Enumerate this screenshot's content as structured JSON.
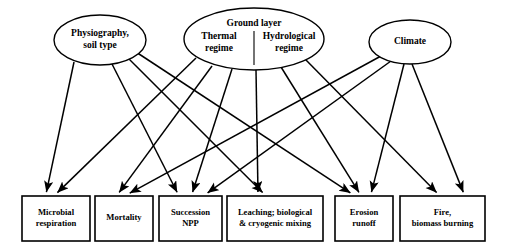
{
  "diagram": {
    "colors": {
      "background": "#ffffff",
      "stroke": "#000000",
      "text": "#000000"
    },
    "drivers": [
      {
        "id": "physiography",
        "shape": "ellipse",
        "lines": [
          "Physiography,",
          "soil type"
        ],
        "cx": 100,
        "cy": 40,
        "rx": 46,
        "ry": 25,
        "divider": false,
        "font_size": 9.5
      },
      {
        "id": "ground-layer",
        "shape": "ellipse",
        "lines": [
          "Ground layer",
          "Thermal",
          "regime",
          "Hydrological",
          "regime"
        ],
        "heading": "Ground layer",
        "left_label": [
          "Thermal",
          "regime"
        ],
        "right_label": [
          "Hydrological",
          "regime"
        ],
        "cx": 254,
        "cy": 39,
        "rx": 70,
        "ry": 31,
        "divider": true,
        "font_size": 9.5
      },
      {
        "id": "climate",
        "shape": "ellipse",
        "lines": [
          "Climate"
        ],
        "cx": 410,
        "cy": 42,
        "rx": 41,
        "ry": 22,
        "divider": false,
        "font_size": 9.5
      }
    ],
    "processes": [
      {
        "id": "microbial-respiration",
        "shape": "box",
        "lines": [
          "Microbial",
          "respiration"
        ],
        "x": 22,
        "y": 196,
        "w": 68,
        "h": 45,
        "font_size": 8.6
      },
      {
        "id": "mortality",
        "shape": "box",
        "lines": [
          "Mortality"
        ],
        "x": 95,
        "y": 196,
        "w": 58,
        "h": 45,
        "font_size": 8.6
      },
      {
        "id": "succession-npp",
        "shape": "box",
        "lines": [
          "Succession",
          "NPP"
        ],
        "x": 159,
        "y": 196,
        "w": 63,
        "h": 45,
        "font_size": 8.6
      },
      {
        "id": "leaching-mixing",
        "shape": "box",
        "lines": [
          "Leaching; biological",
          "& cryogenic mixing"
        ],
        "x": 227,
        "y": 196,
        "w": 96,
        "h": 45,
        "font_size": 8.6
      },
      {
        "id": "erosion-runoff",
        "shape": "box",
        "lines": [
          "Erosion",
          "runoff"
        ],
        "x": 335,
        "y": 196,
        "w": 58,
        "h": 45,
        "font_size": 8.6
      },
      {
        "id": "fire-biomass-burning",
        "shape": "box",
        "lines": [
          "Fire,",
          "biomass burning"
        ],
        "x": 400,
        "y": 196,
        "w": 85,
        "h": 45,
        "font_size": 8.6
      },
      {
        "id": "mortality-alt",
        "shape": "none",
        "lines": [],
        "x": 0,
        "y": 0,
        "w": 0,
        "h": 0,
        "font_size": 0
      }
    ],
    "edges": [
      {
        "id": "physiography-to-microbial-respiration",
        "from": "physiography",
        "to": "microbial-respiration",
        "x1": 74,
        "y1": 62,
        "x2": 46,
        "y2": 194
      },
      {
        "id": "physiography-to-succession-npp",
        "from": "physiography",
        "to": "succession-npp",
        "x1": 112,
        "y1": 64,
        "x2": 178,
        "y2": 194
      },
      {
        "id": "physiography-to-leaching-mixing",
        "from": "physiography",
        "to": "leaching-mixing",
        "x1": 128,
        "y1": 58,
        "x2": 264,
        "y2": 194
      },
      {
        "id": "physiography-to-erosion-runoff",
        "from": "physiography",
        "to": "erosion-runoff",
        "x1": 136,
        "y1": 52,
        "x2": 352,
        "y2": 194
      },
      {
        "id": "ground-layer-to-microbial-respiration",
        "from": "ground-layer",
        "to": "microbial-respiration",
        "x1": 196,
        "y1": 58,
        "x2": 56,
        "y2": 194
      },
      {
        "id": "ground-layer-to-mortality",
        "from": "ground-layer",
        "to": "mortality",
        "x1": 212,
        "y1": 66,
        "x2": 118,
        "y2": 194
      },
      {
        "id": "ground-layer-to-succession-npp",
        "from": "ground-layer",
        "to": "succession-npp",
        "x1": 232,
        "y1": 69,
        "x2": 192,
        "y2": 194
      },
      {
        "id": "ground-layer-to-leaching-mixing",
        "from": "ground-layer",
        "to": "leaching-mixing",
        "x1": 256,
        "y1": 70,
        "x2": 258,
        "y2": 194
      },
      {
        "id": "ground-layer-to-erosion-runoff",
        "from": "ground-layer",
        "to": "erosion-runoff",
        "x1": 281,
        "y1": 67,
        "x2": 360,
        "y2": 194
      },
      {
        "id": "ground-layer-to-fire-biomass-burning",
        "from": "ground-layer",
        "to": "fire-biomass-burning",
        "x1": 305,
        "y1": 59,
        "x2": 438,
        "y2": 194
      },
      {
        "id": "climate-to-mortality",
        "from": "climate",
        "to": "mortality",
        "x1": 381,
        "y1": 56,
        "x2": 128,
        "y2": 194
      },
      {
        "id": "climate-to-succession-npp",
        "from": "climate",
        "to": "succession-npp",
        "x1": 391,
        "y1": 61,
        "x2": 206,
        "y2": 194
      },
      {
        "id": "climate-to-erosion-runoff",
        "from": "climate",
        "to": "erosion-runoff",
        "x1": 404,
        "y1": 64,
        "x2": 371,
        "y2": 194
      },
      {
        "id": "climate-to-fire-biomass-burning",
        "from": "climate",
        "to": "fire-biomass-burning",
        "x1": 412,
        "y1": 64,
        "x2": 464,
        "y2": 194
      }
    ]
  }
}
